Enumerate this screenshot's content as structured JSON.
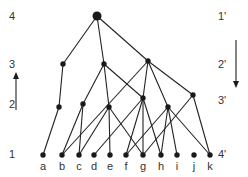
{
  "diagram": {
    "type": "hasse-diagram",
    "left_levels": [
      {
        "label": "4",
        "x": 12,
        "y": 20
      },
      {
        "label": "3",
        "x": 12,
        "y": 68
      },
      {
        "label": "2",
        "x": 12,
        "y": 108
      },
      {
        "label": "1",
        "x": 12,
        "y": 158
      }
    ],
    "right_levels": [
      {
        "label": "1'",
        "x": 218,
        "y": 20
      },
      {
        "label": "2'",
        "x": 218,
        "y": 68
      },
      {
        "label": "3'",
        "x": 218,
        "y": 104
      },
      {
        "label": "4'",
        "x": 218,
        "y": 158
      }
    ],
    "bottom_labels": [
      {
        "label": "a",
        "x": 43
      },
      {
        "label": "b",
        "x": 62
      },
      {
        "label": "c",
        "x": 79
      },
      {
        "label": "d",
        "x": 94
      },
      {
        "label": "e",
        "x": 110
      },
      {
        "label": "f",
        "x": 126
      },
      {
        "label": "g",
        "x": 143
      },
      {
        "label": "h",
        "x": 161
      },
      {
        "label": "i",
        "x": 177
      },
      {
        "label": "j",
        "x": 194
      },
      {
        "label": "k",
        "x": 210
      }
    ],
    "arrows": {
      "up": {
        "x": 16,
        "y1": 110,
        "y2": 72,
        "direction": "up"
      },
      "down": {
        "x": 236,
        "y1": 40,
        "y2": 88,
        "direction": "down"
      }
    },
    "nodes": {
      "top": {
        "x": 97,
        "y": 16,
        "r": 4.5
      },
      "L3a": {
        "x": 63,
        "y": 64,
        "r": 2.7
      },
      "L3b": {
        "x": 104,
        "y": 64,
        "r": 2.7
      },
      "L3c": {
        "x": 148,
        "y": 61,
        "r": 2.7
      },
      "A": {
        "x": 59,
        "y": 107,
        "r": 2.7
      },
      "B": {
        "x": 83,
        "y": 104,
        "r": 2.7
      },
      "C": {
        "x": 109,
        "y": 107,
        "r": 2.7
      },
      "D": {
        "x": 143,
        "y": 98,
        "r": 2.7
      },
      "E": {
        "x": 168,
        "y": 107,
        "r": 2.7
      },
      "F": {
        "x": 193,
        "y": 95,
        "r": 2.7
      },
      "a": {
        "x": 43,
        "y": 155,
        "r": 2.7
      },
      "b": {
        "x": 62,
        "y": 155,
        "r": 2.7
      },
      "c": {
        "x": 79,
        "y": 155,
        "r": 2.7
      },
      "d": {
        "x": 94,
        "y": 155,
        "r": 2.7
      },
      "e": {
        "x": 110,
        "y": 155,
        "r": 2.7
      },
      "f": {
        "x": 126,
        "y": 155,
        "r": 2.7
      },
      "g": {
        "x": 143,
        "y": 155,
        "r": 2.7
      },
      "h": {
        "x": 161,
        "y": 155,
        "r": 2.7
      },
      "i": {
        "x": 177,
        "y": 155,
        "r": 2.7
      },
      "j": {
        "x": 194,
        "y": 155,
        "r": 2.7
      },
      "k": {
        "x": 210,
        "y": 155,
        "r": 2.7
      }
    },
    "edges": [
      [
        "top",
        "L3a"
      ],
      [
        "top",
        "L3b"
      ],
      [
        "top",
        "L3c"
      ],
      [
        "L3a",
        "A"
      ],
      [
        "L3b",
        "B"
      ],
      [
        "L3b",
        "C"
      ],
      [
        "L3b",
        "D"
      ],
      [
        "L3c",
        "b"
      ],
      [
        "L3c",
        "D"
      ],
      [
        "L3c",
        "E"
      ],
      [
        "L3c",
        "F"
      ],
      [
        "A",
        "a"
      ],
      [
        "B",
        "b"
      ],
      [
        "B",
        "c"
      ],
      [
        "C",
        "c"
      ],
      [
        "C",
        "e"
      ],
      [
        "C",
        "g"
      ],
      [
        "D",
        "d"
      ],
      [
        "D",
        "g"
      ],
      [
        "D",
        "h"
      ],
      [
        "D",
        "f"
      ],
      [
        "E",
        "f"
      ],
      [
        "E",
        "h"
      ],
      [
        "E",
        "i"
      ],
      [
        "E",
        "k"
      ],
      [
        "F",
        "g"
      ],
      [
        "F",
        "k"
      ]
    ],
    "colors": {
      "ink": "#1a1a1a",
      "label": "#333333",
      "background": "#ffffff"
    }
  }
}
